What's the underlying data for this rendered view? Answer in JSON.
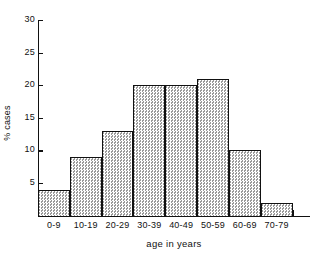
{
  "chart_data": {
    "type": "bar",
    "title": "",
    "subtitle": "",
    "xlabel": "age in years",
    "ylabel": "% cases",
    "categories": [
      "0-9",
      "10-19",
      "20-29",
      "30-39",
      "40-49",
      "50-59",
      "60-69",
      "70-79"
    ],
    "values": [
      4,
      9,
      13,
      20,
      20,
      21,
      10,
      2
    ],
    "series": [
      {
        "name": "% cases",
        "values": [
          4,
          9,
          13,
          20,
          20,
          21,
          10,
          2
        ]
      }
    ],
    "ylim": [
      0,
      30
    ],
    "ytick_labels": [
      "5",
      "10",
      "15",
      "20",
      "25",
      "30"
    ],
    "ytick_values": [
      5,
      10,
      15,
      20,
      25,
      30
    ],
    "grid": false,
    "legend": "none",
    "bar_fill_color": "#c8c8c8",
    "bar_edge_color": "#111111",
    "axis_color": "#111111",
    "background_color": "#ffffff",
    "annotations": []
  }
}
